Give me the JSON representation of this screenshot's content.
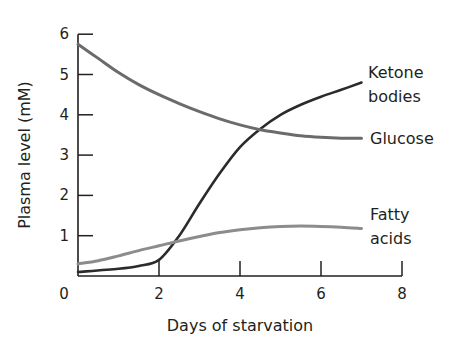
{
  "chart_data": {
    "type": "line",
    "title": "",
    "xlabel": "Days of starvation",
    "ylabel": "Plasma level (mM)",
    "xlim": [
      0,
      8
    ],
    "ylim": [
      0,
      6
    ],
    "xticks": [
      "0",
      "2",
      "4",
      "6",
      "8"
    ],
    "yticks": [
      "1",
      "2",
      "3",
      "4",
      "5",
      "6"
    ],
    "grid": false,
    "legend": "inline labels at right end of each line",
    "series": [
      {
        "name": "Ketone bodies",
        "label_lines": [
          "Ketone",
          "bodies"
        ],
        "color": "#2b2b2b",
        "x": [
          0,
          1,
          1.5,
          2,
          2.5,
          3,
          3.5,
          4,
          4.5,
          5,
          5.5,
          6,
          6.5,
          7
        ],
        "y": [
          0.1,
          0.18,
          0.25,
          0.4,
          1.0,
          1.8,
          2.55,
          3.2,
          3.65,
          4.0,
          4.25,
          4.45,
          4.62,
          4.8
        ]
      },
      {
        "name": "Glucose",
        "label_lines": [
          "Glucose"
        ],
        "color": "#6b6b6b",
        "x": [
          0,
          0.5,
          1,
          1.5,
          2,
          2.5,
          3,
          3.5,
          4,
          4.5,
          5,
          5.5,
          6,
          6.5,
          7
        ],
        "y": [
          5.75,
          5.4,
          5.05,
          4.75,
          4.5,
          4.28,
          4.08,
          3.9,
          3.75,
          3.63,
          3.55,
          3.48,
          3.44,
          3.42,
          3.42
        ]
      },
      {
        "name": "Fatty acids",
        "label_lines": [
          "Fatty",
          "acids"
        ],
        "color": "#8c8c8c",
        "x": [
          0,
          0.5,
          1,
          1.5,
          2,
          2.5,
          3,
          3.5,
          4,
          4.5,
          5,
          5.5,
          6,
          6.5,
          7
        ],
        "y": [
          0.3,
          0.38,
          0.5,
          0.63,
          0.75,
          0.87,
          0.98,
          1.08,
          1.15,
          1.2,
          1.23,
          1.24,
          1.23,
          1.21,
          1.18
        ]
      }
    ]
  }
}
